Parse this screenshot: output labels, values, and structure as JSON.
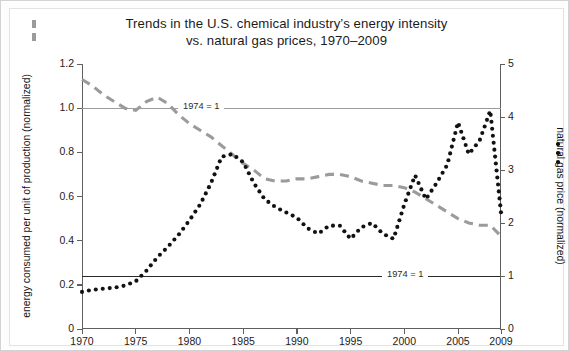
{
  "figure": {
    "title_line1": "Trends in the U.S. chemical industry’s energy intensity",
    "title_line2": "vs. natural gas prices, 1970–2009",
    "background": "#ffffff",
    "border_color": "#d2d2d2"
  },
  "annotations": {
    "ref_gray_label": "1974 = 1",
    "ref_black_label": "1974 = 1"
  },
  "axes": {
    "left": {
      "title": "energy consumed per unit of production (normalized)",
      "ticks": [
        "0",
        "0.2",
        "0.4",
        "0.6",
        "0.8",
        "1.0",
        "1.2"
      ],
      "min": 0,
      "max": 1.2
    },
    "right": {
      "title": "natural gas price (normalized)",
      "ticks": [
        "0",
        "1",
        "2",
        "3",
        "4",
        "5"
      ],
      "min": 0,
      "max": 5
    },
    "bottom": {
      "ticks": [
        "1970",
        "1975",
        "1980",
        "1985",
        "1990",
        "1995",
        "2000",
        "2005",
        "2009"
      ],
      "min": 1970,
      "max": 2009
    }
  },
  "chart_data": {
    "type": "line",
    "title": "Trends in the U.S. chemical industry’s energy intensity vs. natural gas prices, 1970–2009",
    "xlabel": "",
    "ylabel": "energy consumed per unit of production (normalized)",
    "y2label": "natural gas price (normalized)",
    "xlim": [
      1970,
      2009
    ],
    "ylim": [
      0,
      1.2
    ],
    "y2lim": [
      0,
      5
    ],
    "grid": false,
    "legend_position": "axis-labels",
    "reference_lines": [
      {
        "name": "energy-intensity-1974-baseline",
        "axis": "left",
        "value": 1.0,
        "label": "1974 = 1",
        "color": "#9b9b9b"
      },
      {
        "name": "gas-price-1974-baseline",
        "axis": "right",
        "value": 1.0,
        "label": "1974 = 1",
        "color": "#2a2a2a"
      }
    ],
    "x": [
      1970,
      1971,
      1972,
      1973,
      1974,
      1975,
      1976,
      1977,
      1978,
      1979,
      1980,
      1981,
      1982,
      1983,
      1984,
      1985,
      1986,
      1987,
      1988,
      1989,
      1990,
      1991,
      1992,
      1993,
      1994,
      1995,
      1996,
      1997,
      1998,
      1999,
      2000,
      2001,
      2002,
      2003,
      2004,
      2005,
      2006,
      2007,
      2008,
      2009
    ],
    "series": [
      {
        "name": "energy consumed per unit of production (normalized)",
        "axis": "left",
        "style": "dashed",
        "color": "#9b9b9b",
        "values": [
          1.13,
          1.1,
          1.06,
          1.03,
          1.0,
          0.99,
          1.03,
          1.05,
          1.02,
          0.97,
          0.93,
          0.9,
          0.87,
          0.83,
          0.79,
          0.75,
          0.72,
          0.68,
          0.67,
          0.67,
          0.68,
          0.68,
          0.69,
          0.7,
          0.7,
          0.69,
          0.67,
          0.66,
          0.65,
          0.65,
          0.64,
          0.62,
          0.59,
          0.56,
          0.53,
          0.5,
          0.48,
          0.47,
          0.47,
          0.42
        ]
      },
      {
        "name": "natural gas price (normalized)",
        "axis": "right",
        "style": "dotted",
        "color": "#111111",
        "values": [
          0.7,
          0.74,
          0.76,
          0.78,
          0.82,
          0.9,
          1.1,
          1.35,
          1.55,
          1.78,
          2.05,
          2.35,
          2.75,
          3.25,
          3.3,
          3.15,
          2.75,
          2.45,
          2.3,
          2.2,
          2.1,
          1.9,
          1.8,
          1.95,
          1.95,
          1.7,
          1.92,
          2.0,
          1.8,
          1.7,
          2.35,
          2.9,
          2.45,
          2.75,
          3.1,
          3.9,
          3.3,
          3.55,
          4.12,
          2.2
        ]
      }
    ]
  }
}
